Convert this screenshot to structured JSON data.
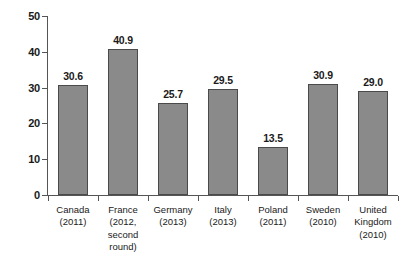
{
  "chart_data": {
    "type": "bar",
    "title": "",
    "subtitle": "",
    "xlabel": "",
    "ylabel": "",
    "ylim": [
      0,
      50
    ],
    "yticks": [
      0,
      10,
      20,
      30,
      40,
      50
    ],
    "ytick_labels": [
      "0",
      "10",
      "20",
      "30",
      "40",
      "50"
    ],
    "grid": false,
    "legend": null,
    "categories": [
      "Canada (2011)",
      "France (2012, second round)",
      "Germany (2013)",
      "Italy (2013)",
      "Poland (2011)",
      "Sweden (2010)",
      "United Kingdom (2010)"
    ],
    "category_lines": [
      [
        "Canada",
        "(2011)"
      ],
      [
        "France",
        "(2012,",
        "second",
        "round)"
      ],
      [
        "Germany",
        "(2013)"
      ],
      [
        "Italy",
        "(2013)"
      ],
      [
        "Poland",
        "(2011)"
      ],
      [
        "Sweden",
        "(2010)"
      ],
      [
        "United",
        "Kingdom",
        "(2010)"
      ]
    ],
    "values": [
      30.6,
      40.9,
      25.7,
      29.5,
      13.5,
      30.9,
      29.0
    ],
    "value_labels": [
      "30.6",
      "40.9",
      "25.7",
      "29.5",
      "13.5",
      "30.9",
      "29.0"
    ],
    "colors": {
      "bar_fill": "#8a8a8a",
      "bar_stroke": "#4a4a4a",
      "axis": "#555555",
      "text": "#1a1a1a",
      "background": "#ffffff"
    }
  }
}
